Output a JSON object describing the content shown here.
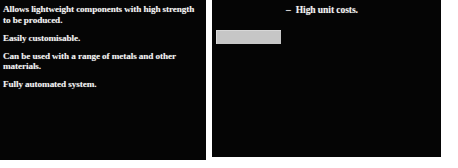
{
  "slides": {
    "left": {
      "name": "advantages-slide",
      "background_color": "#050505",
      "text_color": "#f2f2f2",
      "bullets": [
        {
          "text": "Allows lightweight components with high strength to be produced."
        },
        {
          "text": "Easily customisable."
        },
        {
          "text": "Can be used with a range of metals and other materials."
        },
        {
          "text": "Fully automated system."
        }
      ]
    },
    "right": {
      "name": "disadvantages-slide",
      "background_color": "#050505",
      "text_color": "#f2f2f2",
      "heading": {
        "dash": "–",
        "text": "High unit costs."
      },
      "placeholder_block": {
        "name": "image-placeholder",
        "color": "#c6c6c6"
      }
    }
  }
}
